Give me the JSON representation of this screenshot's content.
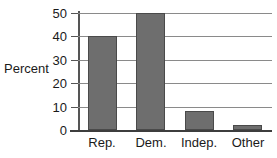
{
  "chart_data": {
    "type": "bar",
    "title": "",
    "xlabel": "",
    "ylabel": "Percent",
    "categories": [
      "Rep.",
      "Dem.",
      "Indep.",
      "Other"
    ],
    "values": [
      40,
      50,
      8,
      2
    ],
    "ylim": [
      0,
      50
    ],
    "yticks": [
      0,
      10,
      20,
      30,
      40,
      50
    ],
    "ytick_labels": [
      "0",
      "10",
      "20",
      "30",
      "40",
      "50"
    ],
    "grid": true,
    "grid_axis": "y",
    "legend": false,
    "legend_position": "none",
    "bar_color": "#6e6e6e",
    "bar_edge_color": "#4a4a4a",
    "grid_color": "#8a8a8a",
    "axis_color": "#555555",
    "background_color": "#ffffff",
    "text_color": "#1a1a1a"
  }
}
